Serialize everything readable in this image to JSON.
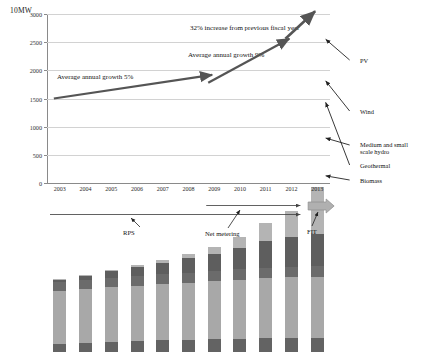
{
  "axis": {
    "unit_label": "10MW",
    "y_ticks": [
      "0",
      "500",
      "1000",
      "1500",
      "2000",
      "2500",
      "3000"
    ],
    "y_min": 0,
    "y_max": 3000
  },
  "annotations": {
    "growth_5": "Average annual growth 5%",
    "growth_9": "Average annual growth 9%",
    "increase_32": "32% increase from previous fiscal year"
  },
  "legend": {
    "pv": "PV",
    "wind": "Wind",
    "hydro": "Medium and small\nscale hydro",
    "hydro_line1": "Medium and small",
    "hydro_line2": "scale hydro",
    "geothermal": "Geothermal",
    "biomass": "Biomass"
  },
  "policies": {
    "rps": "RPS",
    "net_metering": "Net metering",
    "fit": "FIT"
  },
  "colors": {
    "biomass": "#636363",
    "geothermal": "#6b6b6b",
    "hydro": "#a8a8a8",
    "wind": "#5e5e5e",
    "pv": "#b4b4b4",
    "arrow": "#555555",
    "grid": "#d2d2d2",
    "axis": "#8a8a8a"
  },
  "chart_data": {
    "type": "bar",
    "title": "",
    "subtitle": "",
    "xlabel": "",
    "ylabel": "10MW",
    "ylim": [
      0,
      3000
    ],
    "grid": true,
    "stacked": true,
    "legend_position": "right-callouts",
    "categories": [
      "2003",
      "2004",
      "2005",
      "2006",
      "2007",
      "2008",
      "2009",
      "2010",
      "2011",
      "2012",
      "2013"
    ],
    "series": [
      {
        "name": "Biomass",
        "values": [
          140,
          160,
          175,
          195,
          205,
          215,
          225,
          235,
          245,
          250,
          255
        ]
      },
      {
        "name": "Medium and small scale hydro",
        "values": [
          950,
          960,
          975,
          985,
          1000,
          1015,
          1030,
          1050,
          1065,
          1075,
          1085
        ]
      },
      {
        "name": "Geothermal",
        "values": [
          160,
          165,
          170,
          172,
          174,
          176,
          178,
          180,
          182,
          184,
          186
        ]
      },
      {
        "name": "Wind",
        "values": [
          35,
          65,
          110,
          155,
          205,
          260,
          315,
          390,
          470,
          530,
          575
        ]
      },
      {
        "name": "PV",
        "values": [
          5,
          10,
          20,
          35,
          55,
          80,
          120,
          190,
          320,
          460,
          820
        ]
      }
    ],
    "totals": [
      1290,
      1360,
      1450,
      1542,
      1639,
      1746,
      1868,
      2045,
      2282,
      2499,
      2921
    ],
    "trend_arrows": [
      {
        "label": "Average annual growth 5%",
        "from_year": "2003",
        "to_year": "2009",
        "from_value": 1500,
        "to_value": 1920
      },
      {
        "label": "Average annual growth 9%",
        "from_year": "2009",
        "to_year": "2012",
        "from_value": 1780,
        "to_value": 2560
      },
      {
        "label": "32% increase from previous fiscal year",
        "from_year": "2012",
        "to_year": "2013",
        "from_value": 2560,
        "to_value": 3050
      }
    ],
    "policy_timelines": [
      {
        "name": "RPS",
        "start_year": "2003",
        "end_year": "2012"
      },
      {
        "name": "Net metering",
        "start_year": "2009",
        "end_year": "2012"
      },
      {
        "name": "FIT",
        "start_year": "2013",
        "end_year": "2013"
      }
    ]
  }
}
